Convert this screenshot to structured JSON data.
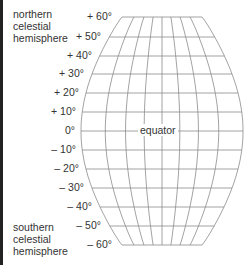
{
  "hemispheres": {
    "north": [
      "northern",
      "celestial",
      "hemisphere"
    ],
    "south": [
      "southern",
      "celestial",
      "hemisphere"
    ]
  },
  "equator_label": "equator",
  "declinations": [
    {
      "label": "+ 60°",
      "y": 17,
      "x": 114
    },
    {
      "label": "+ 50°",
      "y": 37,
      "x": 103
    },
    {
      "label": "+ 40°",
      "y": 56,
      "x": 94
    },
    {
      "label": "+ 30°",
      "y": 74,
      "x": 86
    },
    {
      "label": "+ 20°",
      "y": 93,
      "x": 81
    },
    {
      "label": "+ 10°",
      "y": 112,
      "x": 78
    },
    {
      "label": "0°",
      "y": 131,
      "x": 77
    },
    {
      "label": "– 10°",
      "y": 150,
      "x": 78
    },
    {
      "label": "– 20°",
      "y": 169,
      "x": 81
    },
    {
      "label": "– 30°",
      "y": 188,
      "x": 86
    },
    {
      "label": "– 40°",
      "y": 207,
      "x": 94
    },
    {
      "label": "– 50°",
      "y": 226,
      "x": 103
    },
    {
      "label": "– 60°",
      "y": 245,
      "x": 114
    }
  ],
  "colors": {
    "grid": "#8c8c8c",
    "text": "#333333",
    "border": "#222222"
  }
}
